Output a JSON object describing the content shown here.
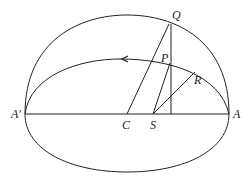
{
  "diagram": {
    "labels": {
      "Q": "Q",
      "P": "P",
      "R": "R",
      "A_prime": "A′",
      "C": "C",
      "S": "S",
      "A": "A"
    },
    "colors": {
      "stroke": "#222222",
      "background": "#ffffff"
    }
  }
}
